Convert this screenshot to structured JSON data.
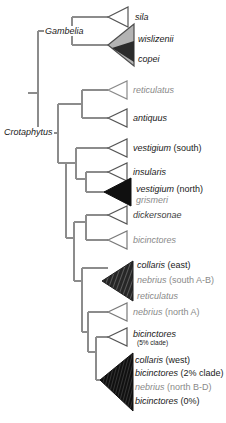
{
  "figure": {
    "type": "phylogenetic-tree",
    "orientation": "left-to-right",
    "tip_style": "collapsed-clade-triangles"
  },
  "genus_labels": [
    {
      "name": "Gambelia",
      "text": "Gambelia"
    },
    {
      "name": "Crotaphytus",
      "text": "Crotaphytus"
    }
  ],
  "tips": [
    {
      "id": "sila",
      "triangle": "open",
      "lines": [
        {
          "species": "sila",
          "qualifier": "",
          "shade": "dark"
        }
      ]
    },
    {
      "id": "wislizenii-copei",
      "triangle": "gray-nested",
      "lines": [
        {
          "species": "wislizenii",
          "qualifier": "",
          "shade": "dark"
        },
        {
          "species": "copei",
          "qualifier": "",
          "shade": "dark"
        }
      ]
    },
    {
      "id": "reticulatus-gambelia",
      "triangle": "open",
      "lines": [
        {
          "species": "reticulatus",
          "qualifier": "",
          "shade": "gray"
        }
      ]
    },
    {
      "id": "antiquus",
      "triangle": "open",
      "lines": [
        {
          "species": "antiquus",
          "qualifier": "",
          "shade": "dark"
        }
      ]
    },
    {
      "id": "vestigium-south",
      "triangle": "open",
      "lines": [
        {
          "species": "vestigium",
          "qualifier": " (south)",
          "shade": "dark"
        }
      ]
    },
    {
      "id": "insularis",
      "triangle": "open",
      "lines": [
        {
          "species": "insularis",
          "qualifier": "",
          "shade": "dark"
        }
      ]
    },
    {
      "id": "vestigium-north-grismeri",
      "triangle": "black",
      "lines": [
        {
          "species": "vestigium",
          "qualifier": " (north)",
          "shade": "dark"
        },
        {
          "species": "grismeri",
          "qualifier": "",
          "shade": "gray"
        }
      ]
    },
    {
      "id": "dickersonae",
      "triangle": "open",
      "lines": [
        {
          "species": "dickersonae",
          "qualifier": "",
          "shade": "dark"
        }
      ]
    },
    {
      "id": "bicinctores-a",
      "triangle": "open",
      "lines": [
        {
          "species": "bicinctores",
          "qualifier": "",
          "shade": "gray"
        }
      ]
    },
    {
      "id": "collaris-east",
      "triangle": "dark-hatched",
      "lines": [
        {
          "species": "collaris",
          "qualifier": " (east)",
          "shade": "dark"
        },
        {
          "species": "nebrius",
          "qualifier": " (south A-B)",
          "shade": "gray"
        },
        {
          "species": "reticulatus",
          "qualifier": "",
          "shade": "gray"
        }
      ]
    },
    {
      "id": "nebrius-north-a",
      "triangle": "open",
      "lines": [
        {
          "species": "nebrius",
          "qualifier": " (north A)",
          "shade": "gray"
        }
      ]
    },
    {
      "id": "bicinctores-5pct",
      "triangle": "open",
      "lines": [
        {
          "species": "bicinctores",
          "qualifier": "",
          "shade": "dark",
          "note": "(5% clade)"
        }
      ]
    },
    {
      "id": "collaris-west",
      "triangle": "black-hatched",
      "lines": [
        {
          "species": "collaris",
          "qualifier": " (west)",
          "shade": "dark"
        },
        {
          "species": "bicinctores",
          "qualifier": " (2% clade)",
          "shade": "dark"
        },
        {
          "species": "nebrius",
          "qualifier": " (north B-D)",
          "shade": "gray"
        },
        {
          "species": "bicinctores",
          "qualifier": " (0%)",
          "shade": "dark"
        }
      ]
    }
  ],
  "colors": {
    "branch": "#8c8c8c",
    "text_dark": "#1a1a1a",
    "text_gray": "#8a8a8a",
    "triangle_outline": "#4d4d4d",
    "triangle_gray_fill": "#b0b0b0",
    "triangle_black_fill": "#111111",
    "background": "#ffffff"
  }
}
